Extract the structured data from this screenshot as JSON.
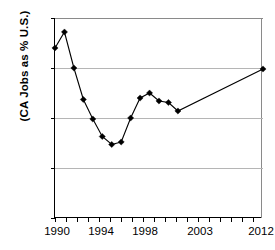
{
  "chart_data": {
    "type": "line",
    "title": "",
    "xlabel": "",
    "ylabel": "(CA Jobs as % U.S.)",
    "ylim": [
      10,
      14
    ],
    "xlim": [
      1990,
      2012
    ],
    "grid": true,
    "legend": "none",
    "marker": "diamond",
    "line_color": "#000000",
    "marker_color": "#000000",
    "gridline_color": "#b5b5b5",
    "ytick_labels": [
      "10%",
      "11%",
      "12%",
      "13%",
      "14%"
    ],
    "ytick_values": [
      10,
      11,
      12,
      13,
      14
    ],
    "xtick_labels": [
      "1990",
      "1994",
      "1998",
      "2003",
      "2012"
    ],
    "xtick_values": [
      1990,
      1994,
      1998,
      2003,
      2012
    ],
    "x": [
      1990,
      1991,
      1992,
      1993,
      1994,
      1995,
      1996,
      1997,
      1998,
      1999,
      2000,
      2001,
      2002,
      2003,
      2012
    ],
    "values": [
      13.4,
      13.72,
      13.0,
      12.37,
      11.98,
      11.63,
      11.47,
      11.52,
      12.0,
      12.4,
      12.5,
      12.34,
      12.31,
      12.14,
      12.98
    ],
    "series": [
      {
        "name": "CA Jobs as % U.S.",
        "values": [
          13.4,
          13.72,
          13.0,
          12.37,
          11.98,
          11.63,
          11.47,
          11.52,
          12.0,
          12.4,
          12.5,
          12.34,
          12.31,
          12.14,
          12.98
        ]
      }
    ]
  }
}
